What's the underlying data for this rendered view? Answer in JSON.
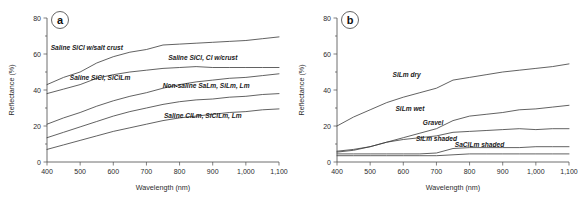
{
  "figure": {
    "background": "#ffffff",
    "curve_color": "#3a3a3a",
    "axis_color": "#4a4a4a"
  },
  "chart_data": [
    {
      "type": "line",
      "panel_tag": "a",
      "title": "",
      "xlabel": "Wavelength (nm)",
      "ylabel": "Reflectance (%)",
      "xlim": [
        400,
        1100
      ],
      "ylim": [
        0,
        80
      ],
      "xticks": [
        400,
        500,
        600,
        700,
        800,
        900,
        1000,
        1100
      ],
      "xticklabels": [
        "400",
        "500",
        "600",
        "700",
        "800",
        "900",
        "1,000",
        "1,100"
      ],
      "yticks": [
        0,
        20,
        40,
        60,
        80
      ],
      "yticklabels": [
        "0",
        "20",
        "40",
        "60",
        "80"
      ],
      "grid": false,
      "legend": "inline-annotations",
      "x": [
        400,
        450,
        500,
        550,
        600,
        650,
        700,
        750,
        800,
        850,
        900,
        950,
        1000,
        1050,
        1100
      ],
      "series": [
        {
          "name": "Saline SiCl w/salt crust",
          "label": "Saline SiCl w/salt crust",
          "label_x": 520,
          "label_y": 62.5,
          "values": [
            43,
            47,
            50,
            55,
            58.5,
            61,
            62.5,
            65,
            65.5,
            66,
            66.5,
            67,
            67.5,
            68.5,
            69.5
          ]
        },
        {
          "name": "Saline SiCl, Cl w/crust",
          "label": "Saline SiCl, Cl w/crust",
          "label_x": 870,
          "label_y": 56.5,
          "values": [
            38,
            40.5,
            43,
            46.5,
            48.5,
            50,
            51,
            52,
            52.5,
            53,
            52.5,
            52.5,
            52.5,
            52.5,
            52.5
          ]
        },
        {
          "name": "Saline SiCl, SiClLm",
          "label": "Saline SiCl, SiClLm",
          "label_x": 560,
          "label_y": 45.5,
          "values": [
            21,
            24.5,
            27.5,
            31,
            34,
            36.5,
            38.5,
            41,
            43,
            44.5,
            45.5,
            46.5,
            47,
            48,
            49
          ]
        },
        {
          "name": "Non-saline SaLm, SiLm, Lm",
          "label": "Non-saline SaLm, SiLm, Lm",
          "label_x": 880,
          "label_y": 41,
          "values": [
            13.5,
            16.5,
            19.5,
            22.5,
            25.5,
            28,
            30,
            32,
            33.5,
            34.5,
            35,
            36,
            36.5,
            37.5,
            38
          ]
        },
        {
          "name": "Saline ClLm, SiClLm, Lm",
          "label": "Saline ClLm, SiClLm, Lm",
          "label_x": 870,
          "label_y": 24.5,
          "values": [
            7,
            9.5,
            12,
            14.5,
            17,
            19,
            21,
            23,
            24.5,
            25.5,
            26.5,
            27.5,
            28,
            29,
            29.5
          ]
        }
      ]
    },
    {
      "type": "line",
      "panel_tag": "b",
      "title": "",
      "xlabel": "Wavelength (nm)",
      "ylabel": "Reflectance (%)",
      "xlim": [
        400,
        1100
      ],
      "ylim": [
        0,
        80
      ],
      "xticks": [
        400,
        500,
        600,
        700,
        800,
        900,
        1000,
        1100
      ],
      "xticklabels": [
        "400",
        "500",
        "600",
        "700",
        "800",
        "900",
        "1,000",
        "1,100"
      ],
      "yticks": [
        0,
        20,
        40,
        60,
        80
      ],
      "yticklabels": [
        "0",
        "20",
        "40",
        "60",
        "80"
      ],
      "grid": false,
      "legend": "inline-annotations",
      "x": [
        400,
        450,
        500,
        550,
        600,
        650,
        700,
        750,
        800,
        850,
        900,
        950,
        1000,
        1050,
        1100
      ],
      "series": [
        {
          "name": "SiLm dry",
          "label": "SiLm dry",
          "label_x": 610,
          "label_y": 47.5,
          "values": [
            20,
            25,
            29,
            33,
            36,
            38.5,
            41,
            45.5,
            47,
            48.5,
            50,
            51,
            52,
            53,
            54.5
          ]
        },
        {
          "name": "SiLm wet",
          "label": "SiLm wet",
          "label_x": 620,
          "label_y": 28.5,
          "values": [
            5.5,
            6.5,
            8.5,
            11,
            13.5,
            16,
            18.5,
            23,
            25.5,
            26.5,
            27.5,
            29,
            29.5,
            30.5,
            31.5
          ]
        },
        {
          "name": "Gravel",
          "label": "Gravel",
          "label_x": 690,
          "label_y": 20.5,
          "values": [
            6,
            7,
            8.5,
            11,
            12.5,
            13.5,
            14.5,
            16.5,
            17,
            17.5,
            18,
            18.5,
            18,
            18.5,
            18.5
          ]
        },
        {
          "name": "SiLm shaded",
          "label": "SiLm shaded",
          "label_x": 700,
          "label_y": 11.5,
          "values": [
            4.5,
            4.5,
            4.5,
            4.5,
            4.5,
            4.5,
            5,
            7.5,
            8,
            8,
            8,
            8,
            8.5,
            8.5,
            8.5
          ]
        },
        {
          "name": "SaClLm shaded",
          "label": "SaClLm shaded",
          "label_x": 830,
          "label_y": 8.5,
          "values": [
            3.5,
            3.5,
            3.5,
            3.5,
            3.5,
            3.5,
            3.5,
            4,
            4.5,
            4.5,
            4.5,
            4.5,
            4.5,
            4.5,
            4.5
          ]
        }
      ]
    }
  ]
}
